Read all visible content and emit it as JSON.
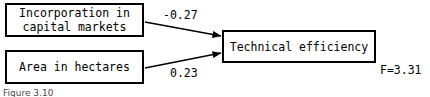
{
  "figure": {
    "caption": "Figure 3.10",
    "background_color": "#ffffff",
    "line_color": "#000000"
  },
  "nodes": {
    "predictor_1": {
      "id": "incorporation-in-capital-markets",
      "label": "Incorporation in\ncapital markets",
      "role": "predictor"
    },
    "predictor_2": {
      "id": "area-in-hectares",
      "label": "Area in hectares",
      "role": "predictor"
    },
    "outcome": {
      "id": "technical-efficiency",
      "label": "Technical efficiency",
      "role": "outcome"
    }
  },
  "edges": [
    {
      "from": "incorporation-in-capital-markets",
      "to": "technical-efficiency",
      "coefficient": "-0.27",
      "sign": "negative"
    },
    {
      "from": "area-in-hectares",
      "to": "technical-efficiency",
      "coefficient": "0.23",
      "sign": "positive"
    }
  ],
  "model_statistics": {
    "f_statistic": "F=3.31",
    "p_value": "p=0.04"
  }
}
